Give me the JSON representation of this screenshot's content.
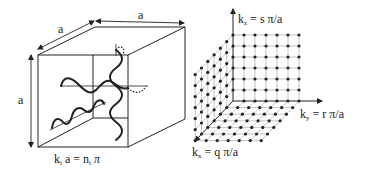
{
  "colors": {
    "ink": "#222222",
    "grid": "#9a9a9a",
    "background": "#ffffff"
  },
  "cube": {
    "label_top": "a",
    "label_depth": "a",
    "label_height": "a",
    "equation": "kᵢ a = nᵢ π",
    "equation_k": "k",
    "equation_sub_i": "i",
    "equation_mid": " a = n",
    "equation_sub_i2": "i",
    "equation_pi": " π"
  },
  "lattice": {
    "kz_label_k": "k",
    "kz_label_sub": "z",
    "kz_label_rest": " = s π/a",
    "ky_label_k": "k",
    "ky_label_sub": "y",
    "ky_label_rest": " = r π/a",
    "kx_label_k": "k",
    "kx_label_sub": "x",
    "kx_label_rest": " = q π/a",
    "grid_size": 7
  }
}
